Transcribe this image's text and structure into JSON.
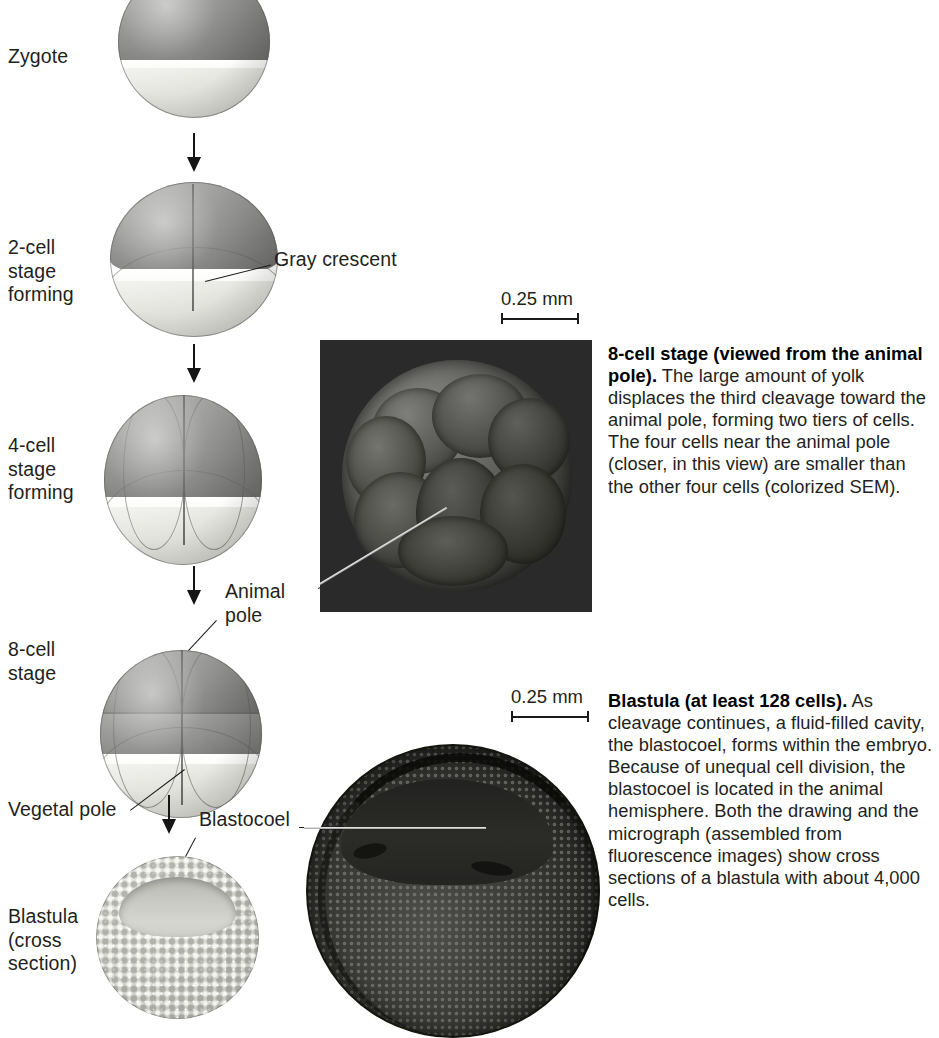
{
  "stages": [
    {
      "id": "zygote",
      "label": "Zygote"
    },
    {
      "id": "two-cell",
      "label": "2-cell\nstage\nforming"
    },
    {
      "id": "four-cell",
      "label": "4-cell\nstage\nforming"
    },
    {
      "id": "eight-cell",
      "label": "8-cell\nstage"
    },
    {
      "id": "blastula",
      "label": "Blastula\n(cross\nsection)"
    }
  ],
  "callouts": [
    {
      "id": "gray-crescent",
      "label": "Gray crescent"
    },
    {
      "id": "animal-pole",
      "label": "Animal\npole"
    },
    {
      "id": "vegetal-pole",
      "label": "Vegetal pole"
    },
    {
      "id": "blastocoel",
      "label": "Blastocoel"
    }
  ],
  "scalebars": [
    {
      "id": "sem-scalebar",
      "label": "0.25 mm"
    },
    {
      "id": "blastula-scalebar",
      "label": "0.25 mm"
    }
  ],
  "captions": [
    {
      "id": "eight-cell-caption",
      "heading": "8-cell stage (viewed from the animal pole).",
      "body": " The large amount of yolk displaces the third cleavage toward the animal pole, forming two tiers of cells. The four cells near the animal pole (closer, in this view) are smaller than the other four cells (colorized SEM)."
    },
    {
      "id": "blastula-caption",
      "heading": "Blastula (at least 128 cells).",
      "body": " As cleavage continues, a fluid-filled cavity, the blastocoel, forms within the embryo. Because of unequal cell division, the blastocoel is located in the animal hemisphere. Both the drawing and the micrograph (assembled from fluorescence images) show cross sections of a blastula with about 4,000 cells."
    }
  ],
  "colors": {
    "animal_pole_gray": "#8e8e8c",
    "vegetal_pole_pale": "#e3e3de",
    "equatorial_band": "#ffffff",
    "sem_background": "#2a2a2a",
    "text": "#231f20",
    "page_background": "#ffffff"
  }
}
